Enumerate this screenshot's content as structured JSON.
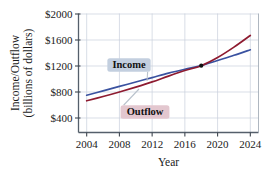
{
  "chart_data": {
    "type": "line",
    "title": "",
    "subtitle": "",
    "xlabel": "Year",
    "ylabel": "Income/Outflow\n(billions of dollars)",
    "ylabel_line1": "Income/Outflow",
    "ylabel_line2": "(billions of dollars)",
    "xlim": [
      2003,
      2025
    ],
    "ylim": [
      250,
      2000
    ],
    "xticks": [
      2004,
      2008,
      2012,
      2016,
      2020,
      2024
    ],
    "xtick_labels": [
      "2004",
      "2008",
      "2012",
      "2016",
      "2020",
      "2024"
    ],
    "yticks": [
      400,
      800,
      1200,
      1600,
      2000
    ],
    "ytick_labels": [
      "$400",
      "$800",
      "$1200",
      "$1600",
      "$2000"
    ],
    "grid": true,
    "grid_color": "#c8d0dc",
    "legend_position": "inline-callouts",
    "series": [
      {
        "name": "Income",
        "color": "#3a52a0",
        "x": [
          2004,
          2006,
          2008,
          2010,
          2012,
          2014,
          2016,
          2018,
          2020,
          2022,
          2024
        ],
        "values": [
          750,
          818,
          886,
          954,
          1022,
          1090,
          1150,
          1205,
          1285,
          1365,
          1450
        ]
      },
      {
        "name": "Outflow",
        "color": "#8e1b30",
        "x": [
          2004,
          2006,
          2008,
          2010,
          2012,
          2014,
          2016,
          2018,
          2020,
          2022,
          2024
        ],
        "values": [
          665,
          730,
          800,
          875,
          955,
          1045,
          1130,
          1205,
          1330,
          1490,
          1670
        ]
      }
    ],
    "annotations": [
      {
        "label": "Income",
        "series": "Income",
        "box_fill": "#c3cfdf",
        "text_x": 129,
        "text_y": 65,
        "point_x": 147,
        "point_y": 81
      },
      {
        "label": "Outflow",
        "series": "Outflow",
        "box_fill": "#e3c7cf",
        "text_x": 145,
        "text_y": 112,
        "point_x": 139,
        "point_y": 89
      }
    ],
    "intersection_point": {
      "x": 2018,
      "y": 1205,
      "marker": "filled-circle",
      "color": "#111111"
    }
  }
}
